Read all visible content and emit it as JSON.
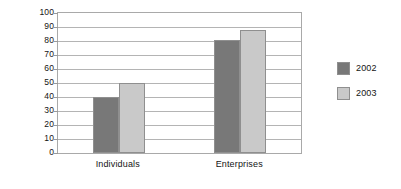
{
  "chart_data": {
    "type": "bar",
    "title": "",
    "subtitle": "",
    "xlabel": "",
    "ylabel": "Percentages",
    "ylim": [
      0,
      100
    ],
    "ytick_step": 10,
    "yticks": [
      0,
      10,
      20,
      30,
      40,
      50,
      60,
      70,
      80,
      90,
      100
    ],
    "grid": true,
    "grid_axis": "y",
    "legend_position": "right",
    "categories": [
      "Individuals",
      "Enterprises"
    ],
    "series": [
      {
        "name": "2002",
        "color": "#787878",
        "values": [
          40,
          81
        ]
      },
      {
        "name": "2003",
        "color": "#c9c9c9",
        "values": [
          50,
          88
        ]
      }
    ],
    "annotations": [],
    "colors": {
      "background": "#ffffff",
      "plot_border": "#a9a9a9",
      "gridline": "#b4b4b4",
      "bar_border": "#8f8f8f",
      "text": "#141414"
    }
  }
}
